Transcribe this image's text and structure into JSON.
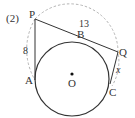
{
  "problem_number": "(2)",
  "points": {
    "P": "P",
    "A": "A",
    "B": "B",
    "Q": "Q",
    "C": "C",
    "O": "O"
  },
  "lengths": {
    "PA": "8",
    "PQ": "13",
    "QC": "x"
  },
  "colors": {
    "stroke": "#333333",
    "dashed": "#999999",
    "background": "#ffffff"
  }
}
